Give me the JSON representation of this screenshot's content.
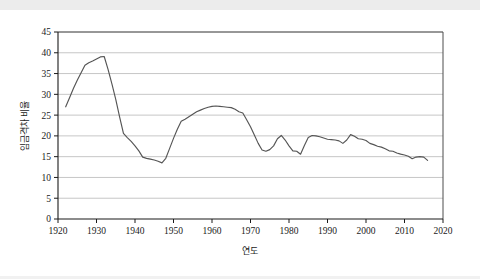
{
  "chart_data": {
    "type": "line",
    "title": "",
    "xlabel": "연도",
    "ylabel": "임금격차 비율",
    "xlim": [
      1920,
      2020
    ],
    "ylim": [
      0,
      45
    ],
    "grid": "horizontal",
    "legend": "none",
    "x_ticks": [
      1920,
      1930,
      1940,
      1950,
      1960,
      1970,
      1980,
      1990,
      2000,
      2010,
      2020
    ],
    "y_ticks": [
      0,
      5,
      10,
      15,
      20,
      25,
      30,
      35,
      40,
      45
    ],
    "line_color": "#555555",
    "series": [
      {
        "name": "임금격차 비율",
        "x": [
          1922,
          1923,
          1924,
          1925,
          1926,
          1927,
          1928,
          1929,
          1930,
          1931,
          1932,
          1933,
          1934,
          1935,
          1936,
          1937,
          1938,
          1939,
          1940,
          1941,
          1942,
          1943,
          1944,
          1945,
          1946,
          1947,
          1948,
          1949,
          1950,
          1951,
          1952,
          1953,
          1954,
          1955,
          1956,
          1957,
          1958,
          1959,
          1960,
          1961,
          1962,
          1963,
          1964,
          1965,
          1966,
          1967,
          1968,
          1969,
          1970,
          1971,
          1972,
          1973,
          1974,
          1975,
          1976,
          1977,
          1978,
          1979,
          1980,
          1981,
          1982,
          1983,
          1984,
          1985,
          1986,
          1987,
          1988,
          1989,
          1990,
          1991,
          1992,
          1993,
          1994,
          1995,
          1996,
          1997,
          1998,
          1999,
          2000,
          2001,
          2002,
          2003,
          2004,
          2005,
          2006,
          2007,
          2008,
          2009,
          2010,
          2011,
          2012,
          2013,
          2014,
          2015,
          2016
        ],
        "values": [
          27.0,
          29.2,
          31.4,
          33.4,
          35.2,
          37.0,
          37.6,
          38.0,
          38.5,
          39.0,
          39.1,
          36.0,
          32.5,
          28.8,
          24.6,
          20.6,
          19.6,
          18.7,
          17.6,
          16.4,
          14.9,
          14.6,
          14.4,
          14.2,
          13.9,
          13.5,
          14.6,
          17.0,
          19.4,
          21.6,
          23.5,
          24.0,
          24.6,
          25.2,
          25.8,
          26.2,
          26.6,
          26.9,
          27.1,
          27.2,
          27.1,
          27.0,
          26.9,
          26.8,
          26.4,
          25.8,
          25.5,
          23.9,
          22.2,
          20.2,
          18.2,
          16.6,
          16.3,
          16.7,
          17.6,
          19.3,
          20.1,
          19.0,
          17.6,
          16.4,
          16.3,
          15.6,
          17.7,
          19.6,
          20.1,
          20.0,
          19.8,
          19.5,
          19.2,
          19.1,
          19.0,
          18.8,
          18.2,
          19.0,
          20.3,
          19.9,
          19.3,
          19.2,
          18.9,
          18.2,
          17.9,
          17.5,
          17.3,
          16.9,
          16.4,
          16.3,
          15.9,
          15.6,
          15.4,
          15.1,
          14.5,
          14.9,
          15.0,
          14.9,
          14.1
        ]
      }
    ]
  }
}
